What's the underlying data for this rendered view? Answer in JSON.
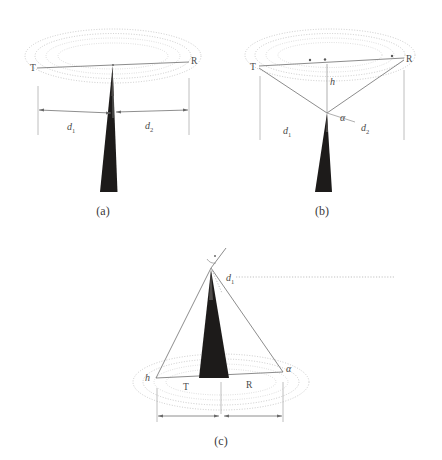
{
  "figure": {
    "type": "three-panel geometric diagram",
    "background_color": "#ffffff",
    "ink_color": "#4a4a4a",
    "wedge_color": "#1d1b1a",
    "ellipse_color": "#b9b9b9"
  },
  "panels": [
    {
      "id": "a",
      "caption": "(a)",
      "labels": {
        "transmitter": "T",
        "receiver": "R",
        "distance_1": "d",
        "distance_1_sub": "1",
        "distance_2": "d",
        "distance_2_sub": "2"
      },
      "ellipse_count": 4,
      "notes": "Wedge apex touches the direct T-R path at its midpoint; dimension line split into d1 and d2"
    },
    {
      "id": "b",
      "caption": "(b)",
      "labels": {
        "transmitter": "T",
        "receiver": "R",
        "height": "h",
        "angle": "α",
        "distance_1": "d",
        "distance_1_sub": "1",
        "distance_2": "d",
        "distance_2_sub": "2"
      },
      "ellipse_count": 4,
      "notes": "Rays from T and R converge at a point below the ellipse plane; h is the vertical drop, alpha the angle at the vertex"
    },
    {
      "id": "c",
      "caption": "(c)",
      "labels": {
        "transmitter": "T",
        "receiver": "R",
        "height": "h",
        "angle": "α",
        "distance_1": "d",
        "distance_1_sub": "1"
      },
      "ellipse_count": 4,
      "notes": "Inverted configuration: apex above the ellipse plane with a horizontal dotted reference line at the apex; d1 marks the angle at the apex"
    }
  ]
}
